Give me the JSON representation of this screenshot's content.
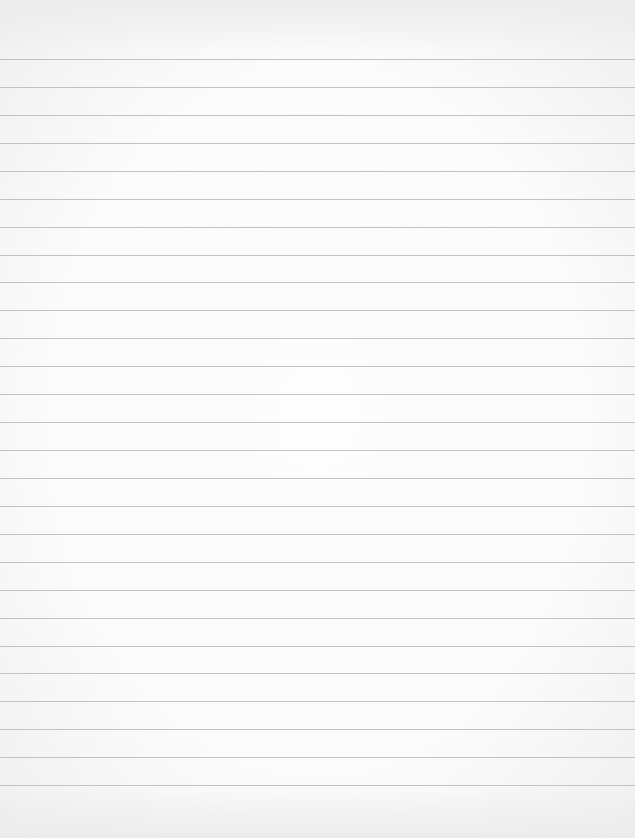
{
  "page": {
    "type": "blank lined paper",
    "width": 635,
    "height": 838,
    "line_color": "#c2c2c2",
    "paper_color": "#fbfbfb",
    "first_line_y": 59,
    "line_spacing": 27.93,
    "line_count": 27
  }
}
